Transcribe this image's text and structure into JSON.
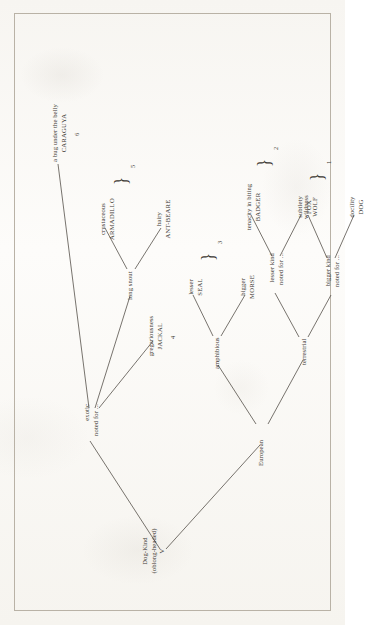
{
  "figure": {
    "type": "taxonomic-tree",
    "title": "Dog-Kind",
    "orientation": "rotated-90-counterclockwise",
    "page_color": "#fbfaf7",
    "ink_color": "#3b3832",
    "border_color": "#b9b2a6"
  },
  "root": {
    "name": "root-node",
    "line1": "Dog-Kind",
    "line2": "(oblong-headed)",
    "line3": "V"
  },
  "branches": {
    "european": {
      "label": "European"
    },
    "exotic": {
      "line1": "exotic",
      "line2": "noted for ..."
    },
    "terrestrial": {
      "label": "terrestrial"
    },
    "amphibious": {
      "label": "amphibious"
    },
    "bigger_kind": {
      "line1": "bigger kind",
      "line2": "noted for ..."
    },
    "lesser_kind": {
      "line1": "lesser kind",
      "line2": "noted for ..."
    },
    "long_snout": {
      "label": "long snout"
    }
  },
  "leaves": [
    {
      "id": "dog",
      "quality": "docility",
      "name": "DOG",
      "group": "1"
    },
    {
      "id": "wolf",
      "quality": "wildness",
      "name": "WOLF",
      "group": "1"
    },
    {
      "id": "fox",
      "quality": "subtlety",
      "name": "FOX",
      "group": "2"
    },
    {
      "id": "badger",
      "quality": "tenacity in biting",
      "name": "BADGER",
      "group": "2"
    },
    {
      "id": "morse",
      "quality": "bigger",
      "name": "MORSE",
      "group": "3"
    },
    {
      "id": "seal",
      "quality": "lesser",
      "name": "SEAL",
      "group": "3"
    },
    {
      "id": "jackal",
      "quality": "gregariousness",
      "name": "JACKAL",
      "group": "4"
    },
    {
      "id": "ant-beare",
      "quality": "hairy",
      "name": "ANT-BEARE",
      "group": "5"
    },
    {
      "id": "armadillo",
      "quality": "crustaceous",
      "name": "ARMADILLO",
      "group": "5"
    },
    {
      "id": "caraguya",
      "quality": "a bug under the belly",
      "name": "CARAGUYA",
      "group": "6"
    }
  ],
  "group_numbers": {
    "g1": "1",
    "g2": "2",
    "g3": "3",
    "g4": "4",
    "g5": "5",
    "g6": "6"
  },
  "brace_glyph": "}"
}
